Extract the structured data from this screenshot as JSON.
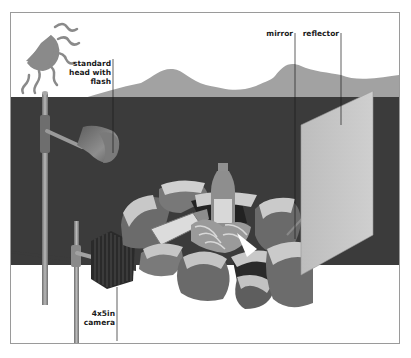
{
  "diagram": {
    "title": "",
    "labels": {
      "standard_head": [
        "standard",
        "head with",
        "flash"
      ],
      "mirror": "mirror",
      "reflector": "reflector",
      "camera": [
        "4x5in",
        "camera"
      ]
    },
    "colors": {
      "backdrop": "#3d3d3d",
      "hills": "#9e9e9e",
      "sun": "#8a8a8a",
      "reflector": "#c4c4c4",
      "rods": "#8f8f8f",
      "camera": "#2a2a2a",
      "frame_border": "#9a9a9a"
    }
  }
}
